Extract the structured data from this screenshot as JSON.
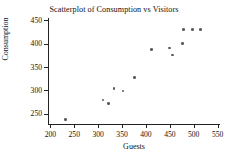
{
  "figure": {
    "top_cut_text": "",
    "background": "#ffffff",
    "point_color": "#5c5c5c",
    "axis_color": "#222222"
  },
  "chart_data": {
    "type": "scatter",
    "title": "Scatterplot of Consumption vs Visitors",
    "xlabel": "Guests",
    "ylabel": "Consumption",
    "xlim": [
      195,
      555
    ],
    "ylim": [
      228,
      455
    ],
    "grid": false,
    "legend": null,
    "xticks": [
      200,
      250,
      300,
      350,
      400,
      450,
      500,
      550
    ],
    "xtick_labels": [
      "200",
      "250",
      "300",
      "350",
      "400",
      "450",
      "500",
      "550"
    ],
    "yticks": [
      250,
      300,
      350,
      400,
      450
    ],
    "ytick_labels": [
      "250",
      "300",
      "350",
      "400",
      "450"
    ],
    "points": [
      {
        "x": 232,
        "y": 238
      },
      {
        "x": 310,
        "y": 279
      },
      {
        "x": 322,
        "y": 272
      },
      {
        "x": 333,
        "y": 304
      },
      {
        "x": 352,
        "y": 299
      },
      {
        "x": 376,
        "y": 328
      },
      {
        "x": 412,
        "y": 387
      },
      {
        "x": 449,
        "y": 391
      },
      {
        "x": 456,
        "y": 376
      },
      {
        "x": 477,
        "y": 400
      },
      {
        "x": 479,
        "y": 430
      },
      {
        "x": 497,
        "y": 430
      },
      {
        "x": 514,
        "y": 430
      }
    ]
  }
}
